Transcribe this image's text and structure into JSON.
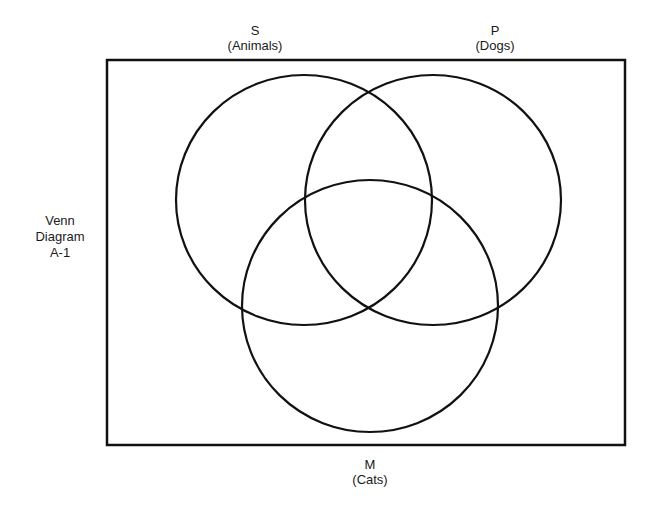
{
  "diagram": {
    "type": "venn",
    "title": {
      "line1": "Venn",
      "line2": "Diagram",
      "line3": "A-1"
    },
    "sets": [
      {
        "letter": "S",
        "name": "(Animals)",
        "cx": 304,
        "cy": 200,
        "rx": 128,
        "ry": 125
      },
      {
        "letter": "P",
        "name": "(Dogs)",
        "cx": 433,
        "cy": 200,
        "rx": 128,
        "ry": 125
      },
      {
        "letter": "M",
        "name": "(Cats)",
        "cx": 370,
        "cy": 306,
        "rx": 128,
        "ry": 126
      }
    ],
    "frame": {
      "x": 107,
      "y": 60,
      "width": 518,
      "height": 385
    },
    "stroke_color": "#111111"
  }
}
